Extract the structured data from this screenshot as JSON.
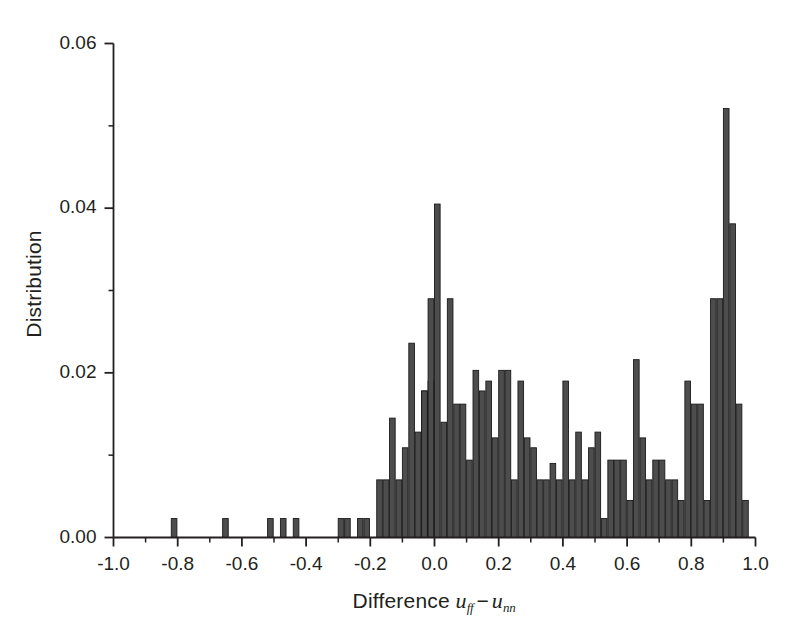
{
  "chart_data": {
    "type": "bar",
    "title": "",
    "subtitle": "",
    "xlabel": "Difference u_ff - u_nn",
    "xlabel_parts": {
      "prefix": "Difference",
      "term1_base": "u",
      "term1_sub": "ff",
      "operator": "−",
      "term2_base": "u",
      "term2_sub": "nn"
    },
    "ylabel": "Distribution",
    "xlim": [
      -1.0,
      1.0
    ],
    "ylim": [
      0.0,
      0.06
    ],
    "xticks": [
      -1.0,
      -0.8,
      -0.6,
      -0.4,
      -0.2,
      0.0,
      0.2,
      0.4,
      0.6,
      0.8,
      1.0
    ],
    "xtick_labels": [
      "-1.0",
      "-0.8",
      "-0.6",
      "-0.4",
      "-0.2",
      "0.0",
      "0.2",
      "0.4",
      "0.6",
      "0.8",
      "1.0"
    ],
    "xminor_ticks": [
      -0.9,
      -0.7,
      -0.5,
      -0.3,
      -0.1,
      0.1,
      0.3,
      0.5,
      0.7,
      0.9
    ],
    "yticks": [
      0.0,
      0.02,
      0.04,
      0.06
    ],
    "ytick_labels": [
      "0.00",
      "0.02",
      "0.04",
      "0.06"
    ],
    "yminor_ticks": [
      0.01,
      0.03,
      0.05
    ],
    "grid": false,
    "legend": null,
    "bin_width": 0.02,
    "bar_color": "#4d4d4d",
    "bar_edge_color": "#1a1a1a",
    "axis_color": "#231f20",
    "background": "#ffffff",
    "note": "Histogram of pairwise interaction-energy differences; bars given as [bin_left_edge, height].",
    "bins": [
      [
        -0.82,
        0.0023
      ],
      [
        -0.66,
        0.0023
      ],
      [
        -0.52,
        0.0023
      ],
      [
        -0.48,
        0.0023
      ],
      [
        -0.44,
        0.0023
      ],
      [
        -0.3,
        0.0023
      ],
      [
        -0.28,
        0.0023
      ],
      [
        -0.24,
        0.0023
      ],
      [
        -0.22,
        0.0023
      ],
      [
        -0.18,
        0.007
      ],
      [
        -0.16,
        0.007
      ],
      [
        -0.14,
        0.0145
      ],
      [
        -0.12,
        0.007
      ],
      [
        -0.1,
        0.0109
      ],
      [
        -0.08,
        0.0236
      ],
      [
        -0.06,
        0.0128
      ],
      [
        -0.04,
        0.0178
      ],
      [
        -0.04,
        0.0178
      ],
      [
        -0.02,
        0.019
      ],
      [
        -0.02,
        0.029
      ],
      [
        0.0,
        0.0405
      ],
      [
        0.02,
        0.014
      ],
      [
        0.04,
        0.029
      ],
      [
        0.06,
        0.0162
      ],
      [
        0.08,
        0.0162
      ],
      [
        0.1,
        0.0094
      ],
      [
        0.12,
        0.0203
      ],
      [
        0.14,
        0.0178
      ],
      [
        0.16,
        0.019
      ],
      [
        0.18,
        0.0121
      ],
      [
        0.2,
        0.0203
      ],
      [
        0.22,
        0.0203
      ],
      [
        0.24,
        0.007
      ],
      [
        0.26,
        0.019
      ],
      [
        0.28,
        0.0121
      ],
      [
        0.3,
        0.0109
      ],
      [
        0.32,
        0.007
      ],
      [
        0.34,
        0.007
      ],
      [
        0.36,
        0.009
      ],
      [
        0.38,
        0.007
      ],
      [
        0.4,
        0.019
      ],
      [
        0.42,
        0.007
      ],
      [
        0.44,
        0.0128
      ],
      [
        0.46,
        0.007
      ],
      [
        0.48,
        0.0109
      ],
      [
        0.5,
        0.0128
      ],
      [
        0.52,
        0.0023
      ],
      [
        0.54,
        0.0094
      ],
      [
        0.56,
        0.0094
      ],
      [
        0.58,
        0.0094
      ],
      [
        0.6,
        0.0045
      ],
      [
        0.62,
        0.0216
      ],
      [
        0.64,
        0.0121
      ],
      [
        0.66,
        0.007
      ],
      [
        0.68,
        0.0094
      ],
      [
        0.7,
        0.0094
      ],
      [
        0.72,
        0.007
      ],
      [
        0.74,
        0.007
      ],
      [
        0.76,
        0.0045
      ],
      [
        0.78,
        0.019
      ],
      [
        0.8,
        0.0162
      ],
      [
        0.82,
        0.0162
      ],
      [
        0.84,
        0.0045
      ],
      [
        0.86,
        0.029
      ],
      [
        0.88,
        0.029
      ],
      [
        0.9,
        0.0521
      ],
      [
        0.92,
        0.0381
      ],
      [
        0.94,
        0.0162
      ],
      [
        0.96,
        0.0045
      ]
    ]
  }
}
